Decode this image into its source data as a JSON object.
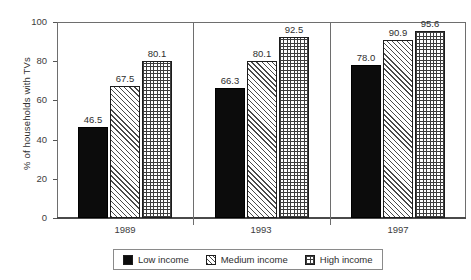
{
  "chart_data": {
    "type": "bar",
    "title": "",
    "xlabel": "",
    "ylabel": "% of households with TVs",
    "ylim": [
      0,
      100
    ],
    "yticks": [
      0,
      20,
      40,
      60,
      80,
      100
    ],
    "ytick_labels": [
      "0",
      "20",
      "40",
      "60",
      "80",
      "100"
    ],
    "grid": false,
    "legend_position": "bottom",
    "categories": [
      "1989",
      "1993",
      "1997"
    ],
    "series": [
      {
        "name": "Low income",
        "pattern": "solid-black",
        "values": [
          46.5,
          67.5,
          80.1
        ]
      },
      {
        "name": "Medium income",
        "pattern": "diagonal-hatch",
        "values": [
          66.3,
          80.1,
          92.5
        ]
      },
      {
        "name": "High income",
        "pattern": "cross-hatch",
        "values": [
          78.0,
          90.9,
          95.6
        ]
      }
    ],
    "bars": [
      {
        "group": "1989",
        "series": "Low income",
        "value": 46.5,
        "label": "46.5"
      },
      {
        "group": "1989",
        "series": "Medium income",
        "value": 67.5,
        "label": "67.5"
      },
      {
        "group": "1989",
        "series": "High income",
        "value": 80.1,
        "label": "80.1"
      },
      {
        "group": "1993",
        "series": "Low income",
        "value": 66.3,
        "label": "66.3"
      },
      {
        "group": "1993",
        "series": "Medium income",
        "value": 80.1,
        "label": "80.1"
      },
      {
        "group": "1993",
        "series": "High income",
        "value": 92.5,
        "label": "92.5"
      },
      {
        "group": "1997",
        "series": "Low income",
        "value": 78.0,
        "label": "78.0"
      },
      {
        "group": "1997",
        "series": "Medium income",
        "value": 90.9,
        "label": "90.9"
      },
      {
        "group": "1997",
        "series": "High income",
        "value": 95.6,
        "label": "95.6"
      }
    ],
    "colors": {
      "low_income": "#0c0c0c",
      "medium_income": "#4a4a4a",
      "high_income": "#3d3d3d",
      "axis": "#6e6e6e",
      "text": "#2e2e2e",
      "background": "#ffffff"
    }
  },
  "legend": {
    "items": [
      {
        "label": "Low income"
      },
      {
        "label": "Medium income"
      },
      {
        "label": "High income"
      }
    ]
  }
}
